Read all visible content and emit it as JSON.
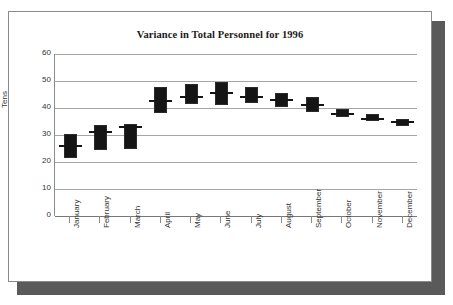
{
  "chart_data": {
    "type": "bar",
    "subtype": "high-low-close",
    "title": "Variance in Total Personnel for 1996",
    "xlabel": "",
    "ylabel": "Tens",
    "ylim": [
      0,
      60
    ],
    "yticks": [
      0,
      10,
      20,
      30,
      40,
      50,
      60
    ],
    "ytick_labels": [
      "0",
      "10",
      "20",
      "30",
      "40",
      "50",
      "60"
    ],
    "grid": true,
    "legend": false,
    "categories": [
      "January",
      "February",
      "March",
      "April",
      "May",
      "June",
      "July",
      "August",
      "September",
      "October",
      "November",
      "December"
    ],
    "series": [
      {
        "name": "High",
        "values": [
          30.3,
          33.6,
          34.0,
          47.8,
          48.8,
          49.5,
          47.8,
          45.7,
          44.0,
          39.5,
          37.8,
          36.1
        ]
      },
      {
        "name": "Low",
        "values": [
          21.5,
          24.5,
          24.8,
          38.0,
          41.3,
          41.0,
          42.0,
          40.3,
          38.5,
          36.8,
          35.3,
          33.5
        ]
      },
      {
        "name": "Close",
        "values": [
          25.8,
          31.2,
          32.8,
          42.7,
          44.0,
          45.6,
          44.2,
          42.8,
          41.0,
          37.7,
          35.8,
          35.0
        ]
      }
    ]
  },
  "frame": {
    "border_color": "#8a8a8a",
    "shadow_color": "#5a5a5a",
    "background": "#ffffff"
  },
  "style": {
    "mark_color": "#151515",
    "gridline_color": "#a6a6a6",
    "axis_color": "#8c8c8c",
    "text_color": "#333333",
    "title_color": "#1a1a1a"
  }
}
